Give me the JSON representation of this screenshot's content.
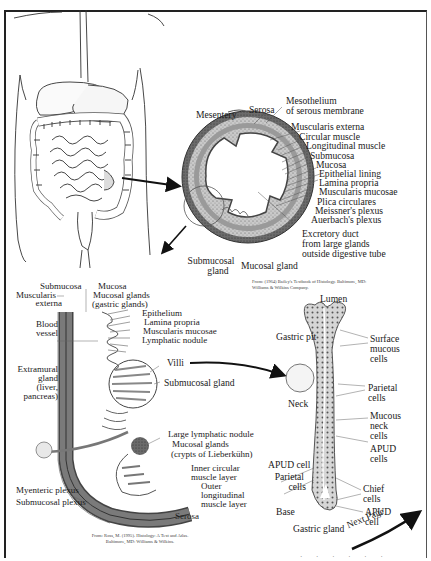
{
  "figure": {
    "torso_diagram": {
      "label": "Human digestive tract (abdomen outline)"
    },
    "cross_section": {
      "labels": {
        "mesentery": "Mesentery",
        "serosa": "Serosa",
        "mesothelium_1": "Mesothelium",
        "mesothelium_2": "of serous membrane",
        "muscularis_externa": "Muscularis externa",
        "circular_muscle": "Circular muscle",
        "longitudinal_muscle": "Longitudinal muscle",
        "submucosa": "Submucosa",
        "mucosa": "Mucosa",
        "epithelial_lining": "Epithelial lining",
        "lamina_propria": "Lamina propria",
        "muscularis_mucosae": "Muscularis mucosae",
        "plica_circulares": "Plica  circulares",
        "meissners_plexus": "Meissner's plexus",
        "auerbachs_plexus": "Auerbach's plexus",
        "excretory_duct_1": "Excretory duct",
        "excretory_duct_2": "from large glands",
        "excretory_duct_3": "outside digestive tube",
        "submucosal_gland_1": "Submucosal",
        "submucosal_gland_2": "gland",
        "mucosal_gland": "Mucosal gland"
      },
      "credit_1": "From: (1964) Bailey's Textbook of Histology. Baltimore, MD:",
      "credit_2": "Williams & Wilkins Company."
    },
    "wall_section": {
      "labels": {
        "submucosa": "Submucosa",
        "mucosa": "Mucosa",
        "mucosal_glands_1": "Mucosal glands",
        "mucosal_glands_2": "(gastric glands)",
        "muscularis_externa_1": "Muscularis",
        "muscularis_externa_2": "externa",
        "epithelium": "Epithelium",
        "lamina_propria": "Lamina propria",
        "muscularis_mucosae": "Muscularis mucosae",
        "lymphatic_nodule": "Lymphatic nodule",
        "blood_vessel_1": "Blood",
        "blood_vessel_2": "vessel",
        "villi": "Villi",
        "submucosal_gland": "Submucosal gland",
        "extramural_1": "Extramural",
        "extramural_2": "gland",
        "extramural_3": "(liver,",
        "extramural_4": "pancreas)",
        "large_lymphatic_nodule": "Large lymphatic nodule",
        "crypts_1": "Mucosal glands",
        "crypts_2": "(crypts of Lieberkühn)",
        "inner_circular_1": "Inner circular",
        "inner_circular_2": "muscle layer",
        "outer_long_1": "Outer",
        "outer_long_2": "longitudinal",
        "outer_long_3": "muscle layer",
        "myenteric_plexus": "Myenteric plexus",
        "submucosal_plexus": "Submucosal plexus",
        "serosa": "Serosa"
      },
      "credit_1": "From: Ross, M. (1995). Histology: A Text and Atlas.",
      "credit_2": "Baltimore, MD: Williams & Wilkins."
    },
    "gastric_gland": {
      "labels": {
        "lumen": "Lumen",
        "gastric_pit": "Gastric pit",
        "surface_mucous_1": "Surface",
        "surface_mucous_2": "mucous",
        "surface_mucous_3": "cells",
        "neck": "Neck",
        "parietal_r_1": "Parietal",
        "parietal_r_2": "cells",
        "mucous_neck_1": "Mucous",
        "mucous_neck_2": "neck",
        "mucous_neck_3": "cells",
        "apud_r_1": "APUD",
        "apud_r_2": "cells",
        "apud_l": "APUD cell",
        "parietal_l_1": "Parietal",
        "parietal_l_2": "cells",
        "chief_1": "Chief",
        "chief_2": "cells",
        "base": "Base",
        "apud_b_1": "APUD",
        "apud_b_2": "cell",
        "gastric_gland": "Gastric gland"
      }
    },
    "navigation": {
      "next_page": "Next Page"
    },
    "footer_fragment": "· · · · · ·"
  }
}
